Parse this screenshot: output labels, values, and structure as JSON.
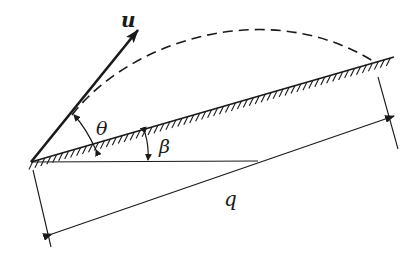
{
  "diagram": {
    "labels": {
      "velocity": "u",
      "launch_angle": "θ",
      "incline_angle": "β",
      "range": "q"
    },
    "colors": {
      "ink": "#1a1a1a",
      "background": "#ffffff"
    },
    "elements": [
      "inclined-plane-with-hatching",
      "horizontal-reference-line",
      "velocity-vector-u",
      "dashed-trajectory",
      "theta-angle-arc",
      "beta-angle-arc",
      "range-dimension-arrow-q"
    ]
  }
}
